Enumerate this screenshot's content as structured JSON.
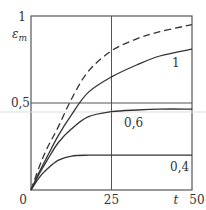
{
  "chart_data": {
    "type": "line",
    "title": "",
    "xlabel": "t",
    "ylabel": "εm",
    "ylabel_main": "ε",
    "ylabel_sub": "m",
    "xlim": [
      0,
      50
    ],
    "ylim": [
      0,
      1
    ],
    "x_ticks": [
      "0",
      "25",
      "50"
    ],
    "y_ticks": [
      "0,5",
      "1"
    ],
    "grid": {
      "vertical": [
        25
      ],
      "horizontal": [
        0.5
      ]
    },
    "legend": null,
    "x": [
      0,
      2.5,
      5,
      8.4,
      12.5,
      17.7,
      25,
      33,
      40,
      50
    ],
    "series": [
      {
        "name": "dashed (limit)",
        "style": "dashed",
        "values": [
          0,
          0.13,
          0.24,
          0.36,
          0.52,
          0.68,
          0.8,
          0.87,
          0.91,
          0.95
        ]
      },
      {
        "name": "1",
        "label": "1",
        "style": "solid",
        "values": [
          0,
          0.1,
          0.19,
          0.31,
          0.43,
          0.56,
          0.65,
          0.72,
          0.77,
          0.81
        ]
      },
      {
        "name": "0,6",
        "label": "0,6",
        "style": "solid",
        "values": [
          0,
          0.09,
          0.17,
          0.27,
          0.35,
          0.42,
          0.45,
          0.46,
          0.465,
          0.465
        ]
      },
      {
        "name": "0,4",
        "label": "0,4",
        "style": "solid",
        "values": [
          0,
          0.07,
          0.12,
          0.17,
          0.195,
          0.2,
          0.2,
          0.2,
          0.2,
          0.2
        ]
      }
    ],
    "annotations": [
      {
        "text": "1",
        "near_series": "1",
        "x": 44,
        "y": 0.72
      },
      {
        "text": "0,6",
        "near_series": "0,6",
        "x": 29,
        "y": 0.36
      },
      {
        "text": "0,4",
        "near_series": "0,4",
        "x": 44,
        "y": 0.12
      }
    ]
  },
  "labels": {
    "y_top": "1",
    "y_mid": "0,5",
    "y_name": "ε",
    "y_sub": "m",
    "x_zero": "0",
    "x_mid": "25",
    "x_end": "50",
    "x_name": "t",
    "curve_1": "1",
    "curve_06": "0,6",
    "curve_04": "0,4"
  }
}
